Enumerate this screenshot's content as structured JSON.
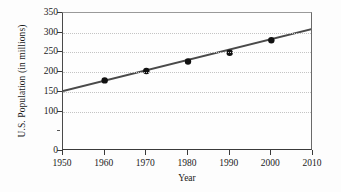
{
  "chart_data": {
    "type": "scatter",
    "title": "",
    "subtitle": "",
    "xlabel": "Year",
    "ylabel": "U.S. Population (in millions)",
    "xlim": [
      1950,
      2010
    ],
    "ylim": [
      0,
      350
    ],
    "grid": "horizontal-dotted",
    "legend": "none",
    "x_ticks": [
      1950,
      1960,
      1970,
      1980,
      1990,
      2000,
      2010
    ],
    "x_tick_labels": [
      "1950",
      "1960",
      "1970",
      "1980",
      "1990",
      "2000",
      "2010"
    ],
    "y_ticks": [
      0,
      50,
      100,
      150,
      200,
      250,
      300,
      350
    ],
    "y_tick_labels": [
      "0",
      "",
      "100",
      "150",
      "200",
      "250",
      "300",
      "350"
    ],
    "series": [
      {
        "name": "U.S. Population",
        "type": "scatter",
        "marker": "filled-circle",
        "color": "#111111",
        "x": [
          1960,
          1970,
          1980,
          1990,
          2000
        ],
        "y": [
          179,
          203,
          227,
          249,
          281
        ],
        "points": [
          {
            "year": 1960,
            "population": 179
          },
          {
            "year": 1970,
            "population": 203
          },
          {
            "year": 1980,
            "population": 227
          },
          {
            "year": 1990,
            "population": 249
          },
          {
            "year": 2000,
            "population": 281
          }
        ]
      },
      {
        "name": "Trend line",
        "type": "line",
        "color": "#4a4a4a",
        "x": [
          1950,
          2010
        ],
        "y": [
          152,
          310
        ]
      }
    ],
    "annotations": []
  },
  "axes": {
    "y_title": "U.S. Population (in millions)",
    "x_title": "Year"
  },
  "colors": {
    "background": "#fdfdfd",
    "plot_background": "#fefefe",
    "axis": "#3a3a3a",
    "gridline": "#c4c4c4",
    "marker": "#111111",
    "trendline": "#4a4a4a",
    "text": "#1a1a1a"
  }
}
